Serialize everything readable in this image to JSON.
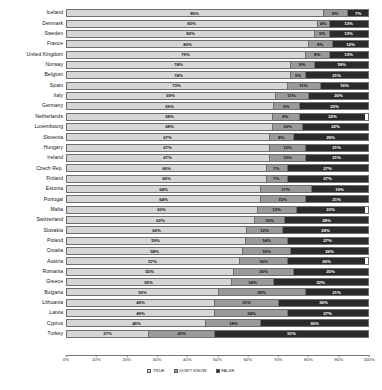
{
  "chart_data": {
    "type": "bar",
    "subtype": "stacked-horizontal-100",
    "title": "",
    "xlabel": "",
    "ylabel": "",
    "xlim": [
      0,
      100
    ],
    "xticks": [
      "0%",
      "10%",
      "20%",
      "30%",
      "40%",
      "50%",
      "60%",
      "70%",
      "80%",
      "90%",
      "100%"
    ],
    "grid": false,
    "legend_position": "bottom-center",
    "value_suffix": "%",
    "categories": [
      "Iceland",
      "Denmark",
      "Sweden",
      "France",
      "United Kingdom",
      "Norway",
      "Belgium",
      "Spain",
      "Italy",
      "Germany",
      "Netherlands",
      "Luxembourg",
      "Slovenia",
      "Hungary",
      "Ireland",
      "Czech Rep.",
      "Finland",
      "Estonia",
      "Portugal",
      "Malta",
      "Switzerland",
      "Slovakia",
      "Poland",
      "Croatia",
      "Austria",
      "Romania",
      "Greece",
      "Bulgaria",
      "Lithuania",
      "Latvia",
      "Cyprus",
      "Turkey"
    ],
    "series": [
      {
        "name": "TRUE",
        "color": "#d6d6d6",
        "values": [
          85,
          83,
          82,
          80,
          79,
          74,
          74,
          73,
          69,
          69,
          68,
          68,
          67,
          67,
          67,
          66,
          66,
          64,
          64,
          63,
          62,
          60,
          59,
          58,
          57,
          55,
          55,
          50,
          49,
          49,
          46,
          27
        ]
      },
      {
        "name": "DON'T KNOW",
        "color": "#9a9a9a",
        "values": [
          8,
          4,
          5,
          8,
          8,
          8,
          5,
          11,
          11,
          9,
          9,
          10,
          8,
          12,
          12,
          7,
          7,
          17,
          15,
          13,
          10,
          12,
          14,
          16,
          16,
          20,
          14,
          29,
          21,
          24,
          18,
          22
        ]
      },
      {
        "name": "FALSE",
        "color": "#2b2b2b",
        "values": [
          7,
          13,
          13,
          12,
          13,
          18,
          21,
          16,
          20,
          23,
          22,
          22,
          25,
          21,
          21,
          27,
          27,
          19,
          21,
          23,
          28,
          29,
          27,
          26,
          26,
          25,
          32,
          21,
          30,
          27,
          36,
          51
        ]
      }
    ],
    "legend": [
      {
        "label": "TRUE",
        "color": "#d6d6d6"
      },
      {
        "label": "DON'T KNOW",
        "color": "#9a9a9a"
      },
      {
        "label": "FALSE",
        "color": "#2b2b2b"
      }
    ]
  }
}
